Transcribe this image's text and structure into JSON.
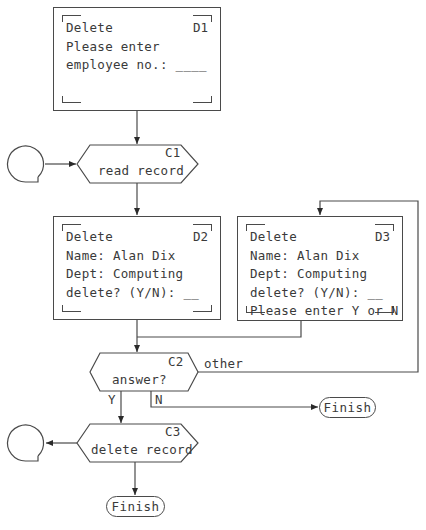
{
  "diagram": {
    "type": "dialogue-flowchart",
    "screens": [
      {
        "id": "D1",
        "lines": [
          "Delete",
          "Please enter",
          "employee no.: ____"
        ]
      },
      {
        "id": "D2",
        "lines": [
          "Delete",
          "Name: Alan Dix",
          "Dept: Computing",
          "delete? (Y/N): __"
        ]
      },
      {
        "id": "D3",
        "lines": [
          "Delete",
          "Name: Alan Dix",
          "Dept: Computing",
          "delete? (Y/N): __",
          "Please enter Y or N"
        ]
      }
    ],
    "computations": [
      {
        "id": "C1",
        "label": "read record"
      },
      {
        "id": "C2",
        "label": "answer?"
      },
      {
        "id": "C3",
        "label": "delete record"
      }
    ],
    "branches": {
      "yes": "Y",
      "no": "N",
      "other": "other"
    },
    "terminals": [
      {
        "label": "Finish"
      },
      {
        "label": "Finish"
      }
    ],
    "edges": [
      {
        "from": "D1",
        "to": "C1"
      },
      {
        "from": "connector-1",
        "to": "C1"
      },
      {
        "from": "C1",
        "to": "D2"
      },
      {
        "from": "D2",
        "to": "C2"
      },
      {
        "from": "D3",
        "to": "C2"
      },
      {
        "from": "C2",
        "to": "C3",
        "label": "Y"
      },
      {
        "from": "C2",
        "to": "Finish",
        "label": "N"
      },
      {
        "from": "C2",
        "to": "D3",
        "label": "other"
      },
      {
        "from": "C3",
        "to": "connector-2"
      },
      {
        "from": "C3",
        "to": "Finish"
      }
    ]
  }
}
